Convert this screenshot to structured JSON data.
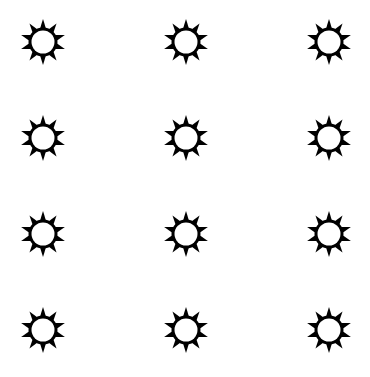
{
  "icon": {
    "name": "sun-icon",
    "color": "#000000",
    "background": "#ffffff",
    "rays": 10
  },
  "grid": {
    "columns": [
      43,
      186,
      329
    ],
    "rows": [
      42,
      138,
      234,
      330
    ]
  }
}
